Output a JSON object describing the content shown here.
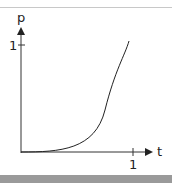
{
  "diagram": {
    "y_axis_label": "p",
    "x_axis_label": "t",
    "y_tick_label": "1",
    "x_tick_label": "1",
    "curve": "ease-in (cubic-like) from (0,0) to (1,1)"
  }
}
